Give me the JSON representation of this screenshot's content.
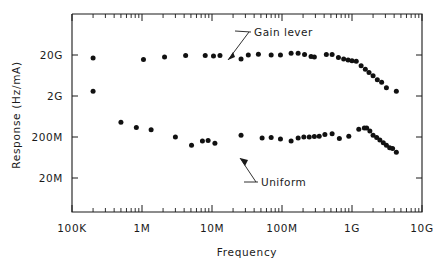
{
  "chart_data": {
    "type": "scatter",
    "title": "",
    "xlabel": "Frequency",
    "ylabel": "Response (Hz/mA)",
    "xscale": "log",
    "yscale": "log",
    "xlim": [
      100000,
      10000000000
    ],
    "ylim": [
      4000000,
      40000000000
    ],
    "grid": false,
    "legend": "annotations-inline",
    "xticklabels": [
      "100K",
      "1M",
      "10M",
      "100M",
      "1G",
      "10G"
    ],
    "xtickvalues": [
      100000,
      1000000,
      10000000,
      100000000,
      1000000000,
      10000000000
    ],
    "yticklabels": [
      "20G",
      "2G",
      "200M",
      "20M"
    ],
    "ytickvalues": [
      20000000000,
      2000000000,
      200000000,
      20000000
    ],
    "annotations": [
      {
        "text": "Gain lever",
        "points_to_series": "Gain lever"
      },
      {
        "text": "Uniform",
        "points_to_series": "Uniform"
      }
    ],
    "series": [
      {
        "name": "Gain lever",
        "marker": "filled-circle",
        "color": "#111111",
        "points": [
          [
            200000.0,
            17000000000.0
          ],
          [
            1050000.0,
            15500000000.0
          ],
          [
            2100000.0,
            18000000000.0
          ],
          [
            4200000.0,
            19500000000.0
          ],
          [
            8000000.0,
            19500000000.0
          ],
          [
            10500000.0,
            19000000000.0
          ],
          [
            13000000.0,
            19500000000.0
          ],
          [
            26000000.0,
            16000000000.0
          ],
          [
            33000000.0,
            20000000000.0
          ],
          [
            46000000.0,
            21000000000.0
          ],
          [
            70000000.0,
            20000000000.0
          ],
          [
            95000000.0,
            20000000000.0
          ],
          [
            135000000.0,
            22000000000.0
          ],
          [
            170000000.0,
            22000000000.0
          ],
          [
            210000000.0,
            20500000000.0
          ],
          [
            260000000.0,
            18500000000.0
          ],
          [
            290000000.0,
            18000000000.0
          ],
          [
            430000000.0,
            20500000000.0
          ],
          [
            520000000.0,
            20500000000.0
          ],
          [
            640000000.0,
            17500000000.0
          ],
          [
            760000000.0,
            16000000000.0
          ],
          [
            880000000.0,
            15000000000.0
          ],
          [
            1000000000.0,
            14500000000.0
          ],
          [
            1150000000.0,
            14000000000.0
          ],
          [
            1350000000.0,
            11000000000.0
          ],
          [
            1550000000.0,
            9000000000.0
          ],
          [
            1750000000.0,
            7500000000.0
          ],
          [
            2000000000.0,
            6200000000.0
          ],
          [
            2300000000.0,
            5000000000.0
          ],
          [
            2650000000.0,
            4300000000.0
          ],
          [
            3100000000.0,
            3200000000.0
          ],
          [
            4300000000.0,
            2600000000.0
          ]
        ]
      },
      {
        "name": "Uniform",
        "marker": "filled-circle",
        "color": "#111111",
        "points": [
          [
            200000.0,
            2600000000.0
          ],
          [
            500000.0,
            460000000.0
          ],
          [
            830000.0,
            340000000.0
          ],
          [
            1350000.0,
            300000000.0
          ],
          [
            3000000.0,
            200000000.0
          ],
          [
            5100000.0,
            125000000.0
          ],
          [
            7300000.0,
            160000000.0
          ],
          [
            8800000.0,
            165000000.0
          ],
          [
            11000000.0,
            140000000.0
          ],
          [
            26000000.0,
            220000000.0
          ],
          [
            52000000.0,
            190000000.0
          ],
          [
            70000000.0,
            195000000.0
          ],
          [
            95000000.0,
            180000000.0
          ],
          [
            135000000.0,
            160000000.0
          ],
          [
            170000000.0,
            190000000.0
          ],
          [
            205000000.0,
            200000000.0
          ],
          [
            245000000.0,
            200000000.0
          ],
          [
            290000000.0,
            205000000.0
          ],
          [
            340000000.0,
            210000000.0
          ],
          [
            410000000.0,
            230000000.0
          ],
          [
            520000000.0,
            240000000.0
          ],
          [
            660000000.0,
            185000000.0
          ],
          [
            900000000.0,
            210000000.0
          ],
          [
            1250000000.0,
            310000000.0
          ],
          [
            1500000000.0,
            330000000.0
          ],
          [
            1620000000.0,
            330000000.0
          ],
          [
            1800000000.0,
            280000000.0
          ],
          [
            2000000000.0,
            220000000.0
          ],
          [
            2250000000.0,
            195000000.0
          ],
          [
            2500000000.0,
            170000000.0
          ],
          [
            2800000000.0,
            145000000.0
          ],
          [
            3100000000.0,
            125000000.0
          ],
          [
            3450000000.0,
            110000000.0
          ],
          [
            3800000000.0,
            105000000.0
          ],
          [
            4300000000.0,
            85000000.0
          ]
        ]
      }
    ]
  },
  "axis": {
    "ylabel": "Response (Hz/mA)",
    "xlabel": "Frequency"
  },
  "annotations": {
    "gain_lever": "Gain lever",
    "uniform": "Uniform"
  }
}
